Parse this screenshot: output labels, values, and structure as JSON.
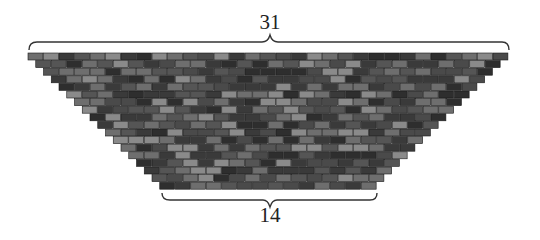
{
  "diagram": {
    "type": "brick-trapezoid",
    "top_label": "31",
    "bottom_label": "14",
    "top_row_bricks": 31,
    "bottom_row_bricks": 14,
    "rows": 18,
    "brick_width": 15.5,
    "row_height": 7.6,
    "top_left_x": 28,
    "top_y": 53,
    "colors": [
      "#3a3a3a",
      "#555555",
      "#6e6e6e",
      "#8a8a8a",
      "#4a4a4a",
      "#2e2e2e"
    ],
    "mortar_color": "#1a1a1a",
    "brace_color": "#333333"
  }
}
